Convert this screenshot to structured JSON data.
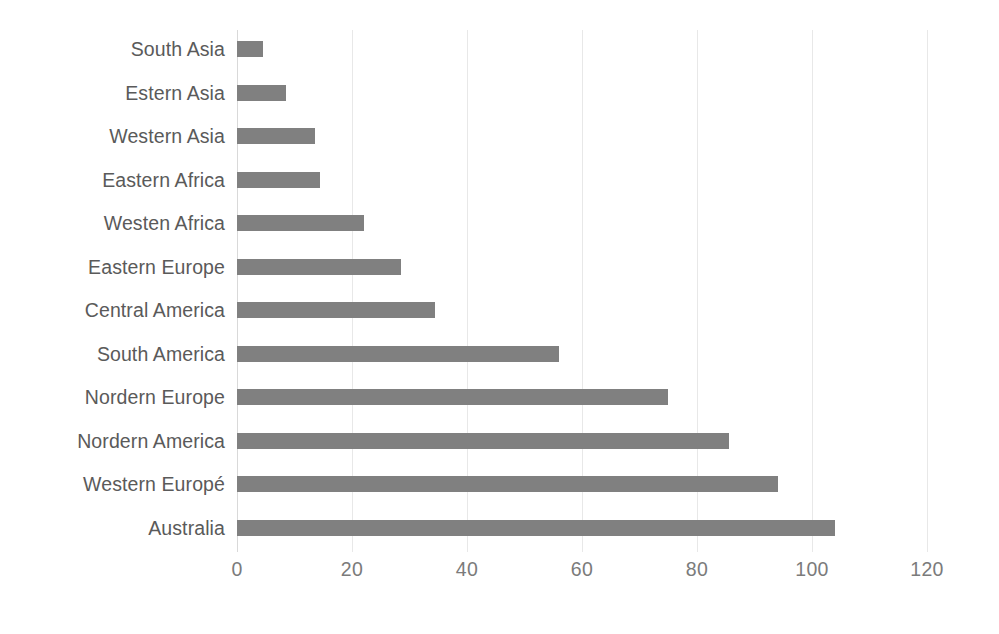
{
  "chart_data": {
    "type": "bar",
    "orientation": "horizontal",
    "title": "",
    "subtitle": "",
    "xlabel": "",
    "ylabel": "",
    "xlim": [
      0,
      120
    ],
    "xticks": [
      "0",
      "20",
      "40",
      "60",
      "80",
      "100",
      "120"
    ],
    "xtick_values": [
      0,
      20,
      40,
      60,
      80,
      100,
      120
    ],
    "grid": true,
    "grid_axis": "x",
    "legend": false,
    "legend_position": "none",
    "bar_color": "#808080",
    "label_color": "#5a5a5a",
    "tick_color": "#7b7b7b",
    "gridline_color": "#e8e8e8",
    "background": "#ffffff",
    "categories": [
      "South Asia",
      "Estern Asia",
      "Western Asia",
      "Eastern Africa",
      "Westen Africa",
      "Eastern Europe",
      "Central America",
      "South America",
      "Nordern Europe",
      "Nordern America",
      "Western Europé",
      "Australia"
    ],
    "values": [
      4.5,
      8.5,
      13.5,
      14.5,
      22,
      28.5,
      34.5,
      56,
      75,
      85.5,
      94,
      104
    ]
  }
}
